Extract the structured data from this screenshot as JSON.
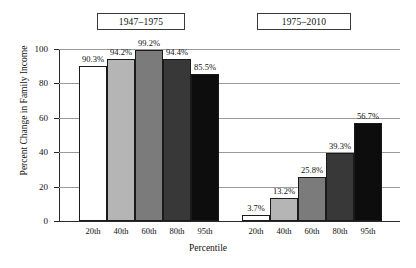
{
  "chart_data": {
    "type": "bar",
    "title": "",
    "xlabel": "Percentile",
    "ylabel": "Percent Change in Family Income",
    "categories": [
      "20th",
      "40th",
      "60th",
      "80th",
      "95th"
    ],
    "ylim": [
      0,
      100
    ],
    "yticks": [
      0,
      20,
      40,
      60,
      80,
      100
    ],
    "ytick_labels": [
      "0",
      "20",
      "40",
      "60",
      "80",
      "100"
    ],
    "grid": true,
    "legend": "none",
    "groups": [
      {
        "label": "1947–1975",
        "values": [
          90.3,
          94.2,
          99.2,
          94.4,
          85.5
        ],
        "data_labels": [
          "90.3%",
          "94.2%",
          "99.2%",
          "94.4%",
          "85.5%"
        ]
      },
      {
        "label": "1975–2010",
        "values": [
          3.7,
          13.2,
          25.8,
          39.3,
          56.7
        ],
        "data_labels": [
          "3.7%",
          "13.2%",
          "25.8%",
          "39.3%",
          "56.7%"
        ]
      }
    ],
    "bar_colors": [
      "#ffffff",
      "#b5b5b5",
      "#7b7b7b",
      "#383838",
      "#0d0d0d"
    ],
    "bar_border_color": "#1a1a1a",
    "gridline_color": "#9a9a9a",
    "axis_color": "#2a2a2a"
  }
}
